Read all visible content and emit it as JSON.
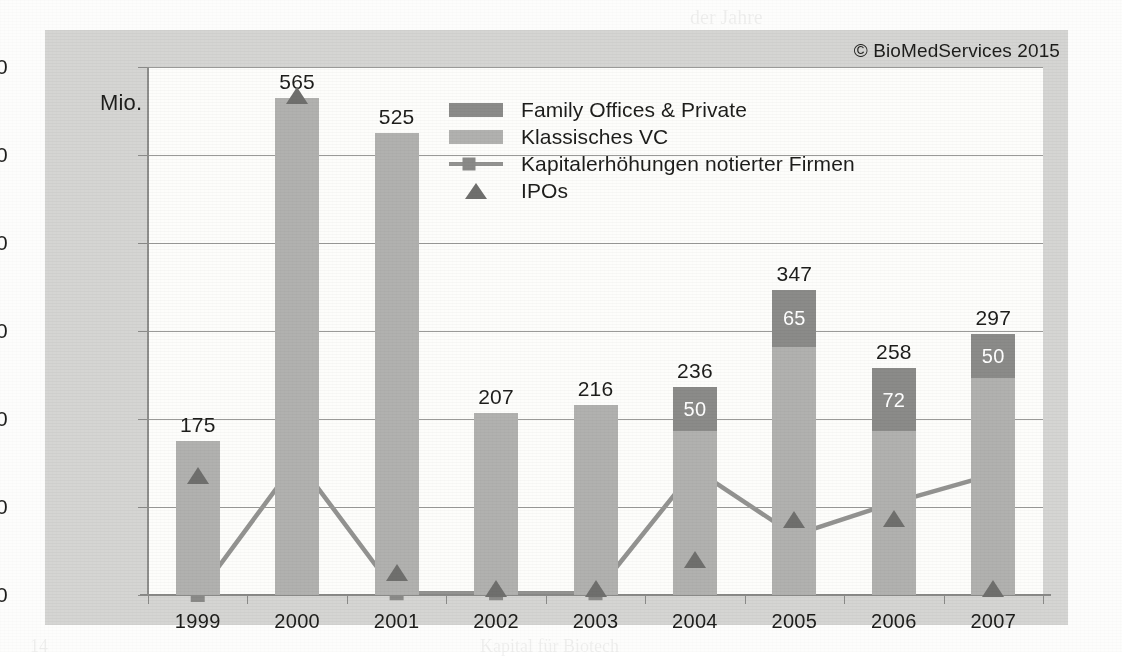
{
  "figure": {
    "unit_label": "Mio. €",
    "copyright": "© BioMedServices 2015"
  },
  "legend": {
    "position": "top-center",
    "items": [
      {
        "label": "Family Offices & Private",
        "marker": "swatch-dark",
        "color": "#8b8b89"
      },
      {
        "label": "Klassisches VC",
        "marker": "swatch-light",
        "color": "#b1b1af"
      },
      {
        "label": "Kapitalerhöhungen notierter Firmen",
        "marker": "line-square",
        "color": "#939391"
      },
      {
        "label": "IPOs",
        "marker": "triangle",
        "color": "#6f6f6d"
      }
    ]
  },
  "chart_data": {
    "type": "bar",
    "title": "",
    "subtitle": "",
    "xlabel": "",
    "ylabel": "Mio. €",
    "ylim": [
      0,
      600
    ],
    "yticks": [
      0,
      100,
      200,
      300,
      400,
      500,
      600
    ],
    "ytick_labels": [
      "0",
      "100",
      "200",
      "300",
      "400",
      "500",
      "600"
    ],
    "grid": true,
    "stacked": true,
    "categories": [
      "1999",
      "2000",
      "2001",
      "2002",
      "2003",
      "2004",
      "2005",
      "2006",
      "2007"
    ],
    "series": [
      {
        "name": "Klassisches VC",
        "type": "bar",
        "color": "#b1b1af",
        "values": [
          175,
          565,
          525,
          207,
          216,
          186,
          282,
          186,
          247
        ]
      },
      {
        "name": "Family Offices & Private",
        "type": "bar",
        "color": "#8b8b89",
        "values": [
          0,
          0,
          0,
          0,
          0,
          50,
          65,
          72,
          50
        ],
        "labels": [
          "",
          "",
          "",
          "",
          "",
          "50",
          "65",
          "72",
          "50"
        ]
      },
      {
        "name": "Kapitalerhöhungen notierter Firmen",
        "type": "line",
        "color": "#939391",
        "marker": "square",
        "values": [
          0,
          153,
          2,
          2,
          2,
          143,
          68,
          105,
          137
        ]
      },
      {
        "name": "IPOs",
        "type": "scatter",
        "color": "#6f6f6d",
        "marker": "triangle",
        "values": [
          128,
          560,
          18,
          0,
          0,
          33,
          78,
          80,
          0
        ]
      }
    ],
    "bar_totals": [
      175,
      565,
      525,
      207,
      216,
      236,
      347,
      258,
      297
    ],
    "bar_total_labels": [
      "175",
      "565",
      "525",
      "207",
      "216",
      "236",
      "347",
      "258",
      "297"
    ]
  }
}
